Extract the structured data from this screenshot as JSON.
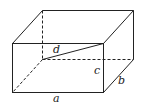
{
  "diagram": {
    "type": "rectangular-box",
    "labels": {
      "a": "a",
      "b": "b",
      "c": "c",
      "d": "d"
    },
    "line_color": "#222222"
  }
}
